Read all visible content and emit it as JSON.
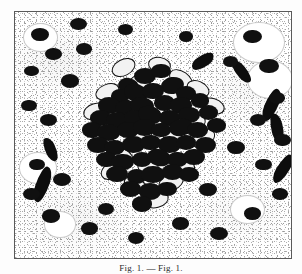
{
  "figure": {
    "kind": "histology-micrograph",
    "title": "",
    "caption": "Fig. 1. — Fig. 1.",
    "caption_visible": "partially cropped at image edge",
    "frame": {
      "border_color": "#5a5a5a",
      "background": "#ffffff"
    },
    "colors": {
      "nucleus_dark": "#101010",
      "nucleus_outline": "#151515",
      "background": "#ffffff",
      "stipple_gray": "#9a9a9a",
      "frame": "#5a5a5a"
    }
  },
  "chart_data": {
    "type": "scatter",
    "title": "",
    "xlabel": "",
    "ylabel": "",
    "xlim": [
      0,
      100
    ],
    "ylim": [
      0,
      100
    ],
    "grid": false,
    "legend": null,
    "annotations": [
      "dense central infiltrate of dark nuclei",
      "sparse peripheral nuclei",
      "stippled background matrix"
    ],
    "series": [
      {
        "name": "dense-cluster-nuclei",
        "style": "solid-dark-ovoid",
        "points": [
          [
            47,
            26,
            4.0,
            3.2,
            0
          ],
          [
            53,
            24,
            3.6,
            3.0,
            0
          ],
          [
            41,
            30,
            3.8,
            3.2,
            12
          ],
          [
            57,
            30,
            4.2,
            3.4,
            -8
          ],
          [
            38,
            34,
            3.4,
            2.9,
            0
          ],
          [
            44,
            33,
            4.4,
            3.6,
            20
          ],
          [
            50,
            32,
            3.9,
            3.3,
            0
          ],
          [
            62,
            33,
            3.5,
            3.0,
            0
          ],
          [
            34,
            38,
            4.0,
            3.3,
            0
          ],
          [
            40,
            39,
            3.7,
            3.1,
            -14
          ],
          [
            46,
            38,
            4.3,
            3.5,
            8
          ],
          [
            54,
            37,
            3.8,
            3.2,
            0
          ],
          [
            60,
            38,
            4.0,
            3.3,
            0
          ],
          [
            67,
            36,
            3.4,
            2.9,
            0
          ],
          [
            31,
            43,
            3.9,
            3.2,
            0
          ],
          [
            37,
            44,
            4.1,
            3.4,
            0
          ],
          [
            43,
            43,
            3.6,
            3.0,
            0
          ],
          [
            49,
            42,
            4.4,
            3.6,
            16
          ],
          [
            56,
            43,
            3.8,
            3.2,
            0
          ],
          [
            63,
            42,
            4.0,
            3.3,
            0
          ],
          [
            70,
            41,
            3.5,
            3.0,
            0
          ],
          [
            28,
            48,
            3.7,
            3.1,
            0
          ],
          [
            34,
            49,
            4.2,
            3.4,
            0
          ],
          [
            41,
            48,
            3.9,
            3.3,
            0
          ],
          [
            47,
            47,
            4.1,
            3.4,
            0
          ],
          [
            53,
            48,
            3.6,
            3.0,
            0
          ],
          [
            60,
            47,
            4.3,
            3.5,
            -10
          ],
          [
            66,
            48,
            3.8,
            3.2,
            0
          ],
          [
            73,
            46,
            3.5,
            3.0,
            0
          ],
          [
            30,
            54,
            4.0,
            3.3,
            0
          ],
          [
            36,
            55,
            3.7,
            3.1,
            0
          ],
          [
            43,
            54,
            4.2,
            3.5,
            0
          ],
          [
            49,
            53,
            3.8,
            3.2,
            0
          ],
          [
            56,
            54,
            4.1,
            3.4,
            0
          ],
          [
            62,
            53,
            3.6,
            3.0,
            0
          ],
          [
            69,
            54,
            3.9,
            3.3,
            0
          ],
          [
            33,
            60,
            3.8,
            3.2,
            0
          ],
          [
            39,
            61,
            4.1,
            3.4,
            0
          ],
          [
            46,
            60,
            3.7,
            3.1,
            0
          ],
          [
            52,
            59,
            4.3,
            3.5,
            14
          ],
          [
            59,
            60,
            3.8,
            3.2,
            0
          ],
          [
            65,
            59,
            4.0,
            3.3,
            0
          ],
          [
            37,
            66,
            3.9,
            3.3,
            0
          ],
          [
            44,
            67,
            3.6,
            3.0,
            0
          ],
          [
            50,
            66,
            4.2,
            3.4,
            0
          ],
          [
            57,
            65,
            3.8,
            3.2,
            0
          ],
          [
            63,
            66,
            3.5,
            3.0,
            0
          ],
          [
            42,
            72,
            3.8,
            3.2,
            0
          ],
          [
            49,
            73,
            4.0,
            3.3,
            0
          ],
          [
            55,
            72,
            3.6,
            3.0,
            0
          ],
          [
            46,
            78,
            3.7,
            3.1,
            0
          ]
        ]
      },
      {
        "name": "ringed-cluster-cells",
        "style": "outlined-ovoid-pale-centre",
        "points": [
          [
            39,
            22,
            4.2,
            3.0,
            -28
          ],
          [
            52,
            21,
            3.8,
            2.8,
            10
          ],
          [
            45,
            28,
            4.0,
            2.9,
            -18
          ],
          [
            60,
            27,
            4.4,
            3.0,
            35
          ],
          [
            33,
            32,
            4.1,
            2.9,
            -22
          ],
          [
            55,
            34,
            4.6,
            3.1,
            -30
          ],
          [
            66,
            31,
            4.0,
            2.9,
            25
          ],
          [
            29,
            40,
            4.3,
            3.0,
            -15
          ],
          [
            44,
            36,
            3.9,
            2.8,
            40
          ],
          [
            58,
            41,
            4.5,
            3.1,
            -26
          ],
          [
            71,
            38,
            4.1,
            2.9,
            18
          ],
          [
            36,
            46,
            4.2,
            3.0,
            -32
          ],
          [
            51,
            45,
            3.8,
            2.8,
            22
          ],
          [
            64,
            45,
            4.4,
            3.0,
            -20
          ],
          [
            32,
            52,
            4.0,
            2.9,
            30
          ],
          [
            45,
            51,
            4.3,
            3.1,
            -24
          ],
          [
            57,
            50,
            3.9,
            2.8,
            16
          ],
          [
            68,
            51,
            4.2,
            3.0,
            -34
          ],
          [
            38,
            58,
            4.1,
            2.9,
            26
          ],
          [
            53,
            57,
            4.5,
            3.1,
            -18
          ],
          [
            61,
            62,
            4.0,
            2.9,
            32
          ],
          [
            35,
            64,
            4.2,
            3.0,
            -28
          ],
          [
            48,
            63,
            3.8,
            2.8,
            20
          ],
          [
            56,
            69,
            4.3,
            3.0,
            -22
          ],
          [
            43,
            70,
            4.0,
            2.9,
            28
          ],
          [
            51,
            76,
            4.1,
            2.9,
            -16
          ]
        ]
      },
      {
        "name": "peripheral-scattered-nuclei",
        "style": "solid-dark-ovoid",
        "points": [
          [
            9,
            9,
            3.2,
            2.6,
            0
          ],
          [
            23,
            5,
            3.0,
            2.4,
            0
          ],
          [
            40,
            7,
            2.8,
            2.3,
            0
          ],
          [
            62,
            10,
            2.6,
            2.2,
            0
          ],
          [
            86,
            10,
            3.4,
            2.8,
            0
          ],
          [
            92,
            22,
            3.6,
            3.0,
            0
          ],
          [
            14,
            17,
            3.0,
            2.5,
            0
          ],
          [
            6,
            24,
            2.7,
            2.2,
            0
          ],
          [
            20,
            28,
            3.3,
            2.7,
            0
          ],
          [
            5,
            38,
            2.9,
            2.4,
            0
          ],
          [
            12,
            44,
            3.1,
            2.5,
            0
          ],
          [
            88,
            44,
            3.0,
            2.5,
            0
          ],
          [
            95,
            35,
            2.8,
            2.3,
            0
          ],
          [
            80,
            55,
            3.2,
            2.6,
            0
          ],
          [
            90,
            62,
            3.0,
            2.4,
            0
          ],
          [
            8,
            62,
            2.9,
            2.4,
            0
          ],
          [
            17,
            68,
            3.3,
            2.7,
            0
          ],
          [
            6,
            74,
            3.0,
            2.5,
            0
          ],
          [
            13,
            83,
            3.4,
            2.8,
            0
          ],
          [
            27,
            88,
            3.1,
            2.6,
            0
          ],
          [
            44,
            92,
            2.9,
            2.4,
            0
          ],
          [
            60,
            86,
            3.0,
            2.5,
            0
          ],
          [
            74,
            90,
            3.3,
            2.7,
            0
          ],
          [
            86,
            82,
            3.1,
            2.6,
            0
          ],
          [
            96,
            74,
            2.8,
            2.3,
            0
          ],
          [
            33,
            80,
            3.0,
            2.5,
            0
          ],
          [
            70,
            72,
            3.2,
            2.6,
            0
          ],
          [
            78,
            20,
            2.7,
            2.2,
            0
          ],
          [
            25,
            15,
            2.8,
            2.3,
            0
          ],
          [
            97,
            52,
            3.0,
            2.5,
            0
          ]
        ]
      },
      {
        "name": "peripheral-halo-cells",
        "style": "large-pale-cell-with-clear-halo",
        "points": [
          [
            88,
            12,
            9.0,
            8.0,
            0
          ],
          [
            92,
            27,
            8.0,
            7.5,
            0
          ],
          [
            9,
            10,
            6.0,
            5.5,
            0
          ],
          [
            8,
            63,
            6.5,
            6.0,
            0
          ],
          [
            16,
            86,
            5.5,
            5.0,
            0
          ],
          [
            84,
            80,
            6.0,
            5.5,
            0
          ]
        ]
      },
      {
        "name": "elongated-dark-structures",
        "style": "curved-streak",
        "points": [
          [
            93,
            38,
            2.4,
            7.0,
            22
          ],
          [
            95,
            47,
            2.2,
            6.0,
            -14
          ],
          [
            10,
            70,
            2.4,
            7.5,
            18
          ],
          [
            97,
            64,
            2.2,
            6.5,
            30
          ],
          [
            82,
            24,
            2.0,
            5.5,
            -40
          ],
          [
            68,
            20,
            2.2,
            5.0,
            55
          ],
          [
            13,
            56,
            2.0,
            5.0,
            -25
          ]
        ]
      }
    ]
  }
}
